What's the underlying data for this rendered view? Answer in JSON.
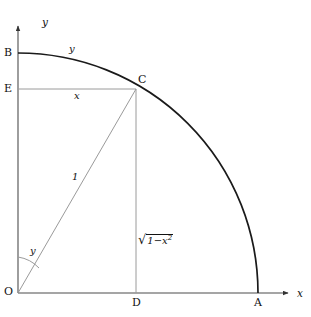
{
  "figure": {
    "background_color": "#ffffff",
    "axis_color": "#4d4d4d",
    "curve_color": "#1a1a1a",
    "construction_line_color": "#9a9a9a",
    "text_color": "#111111"
  },
  "axes": {
    "x_axis_label": "x",
    "y_axis_label": "y",
    "x_axis": {
      "x1": 18,
      "y1": 293,
      "x2": 292,
      "y2": 293
    },
    "y_axis": {
      "x1": 18,
      "y1": 293,
      "x2": 18,
      "y2": 22
    }
  },
  "points": {
    "O": {
      "label": "O",
      "x": 18,
      "y": 293
    },
    "A": {
      "label": "A",
      "x": 258,
      "y": 293
    },
    "B": {
      "label": "B",
      "x": 18,
      "y": 53
    },
    "C": {
      "label": "C",
      "x": 136,
      "y": 89
    },
    "D": {
      "label": "D",
      "x": 136,
      "y": 293
    },
    "E": {
      "label": "E",
      "x": 18,
      "y": 89
    }
  },
  "arc": {
    "name": "quarter-circle-arc",
    "center_x": 18,
    "center_y": 293,
    "radius": 240,
    "start_point": "B",
    "end_point": "A",
    "label": "y"
  },
  "segments": [
    {
      "name": "segment-EC",
      "label": "x",
      "from": "E",
      "to": "C"
    },
    {
      "name": "segment-OC",
      "label": "1",
      "from": "O",
      "to": "C"
    },
    {
      "name": "segment-CD",
      "label": "sqrt(1-x^2)",
      "from": "C",
      "to": "D"
    }
  ],
  "angle": {
    "name": "angle-at-origin",
    "label": "y",
    "vertex": "O",
    "from_ray": "y-axis",
    "to_ray": "OC"
  },
  "labels": {
    "arc_label": "y",
    "segment_x_label": "x",
    "radius_label": "1",
    "radical_lead": "1",
    "radical_minus": "−",
    "radical_var": "x",
    "radical_exp": "2",
    "surd_glyph": "√",
    "angle_label": "y",
    "axis_x": "x",
    "axis_y": "y",
    "point_O": "O",
    "point_A": "A",
    "point_B": "B",
    "point_C": "C",
    "point_D": "D",
    "point_E": "E"
  }
}
